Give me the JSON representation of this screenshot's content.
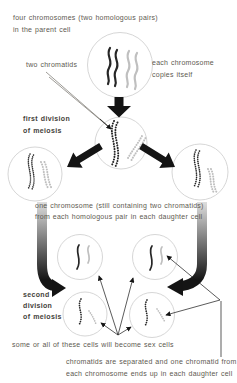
{
  "colors": {
    "background": "#ffffff",
    "text": "#5d5950",
    "text_bold": "#44413a",
    "chromosome_dark": "#262626",
    "chromosome_light": "#bfbfbf",
    "cell_outline": "#cccccc",
    "arrow": "#141414"
  },
  "annotations": {
    "parent_note": [
      "four chromosomes (two homologous pairs)",
      "in the parent cell"
    ],
    "two_chromatids": "two chromatids",
    "copies_note": [
      "each chromosome",
      "copies itself"
    ],
    "first_division": [
      "first division",
      "of meiosis"
    ],
    "daughter_note": [
      "one chromosome (still containing two chromatids)",
      "from each homologous pair in each daughter cell"
    ],
    "second_division": [
      "second",
      "division",
      "of meiosis"
    ],
    "sex_cells_note": "some or all of these cells will become sex cells",
    "separation_note": [
      "chromatids are separated and one chromatid from",
      "each chromosome ends up in each daughter cell"
    ]
  }
}
